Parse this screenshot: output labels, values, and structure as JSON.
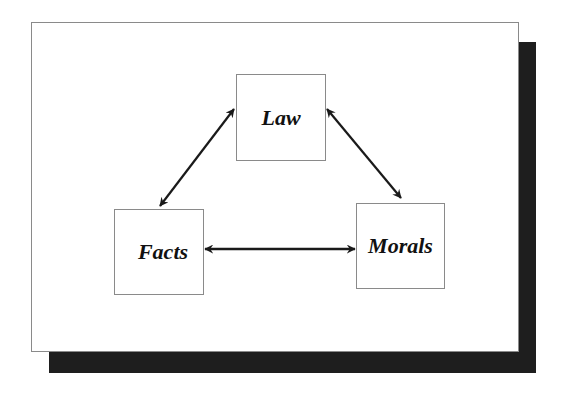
{
  "diagram": {
    "nodes": [
      {
        "id": "law",
        "label": "Law"
      },
      {
        "id": "facts",
        "label": "Facts"
      },
      {
        "id": "morals",
        "label": "Morals"
      }
    ],
    "edges": [
      {
        "from": "facts",
        "to": "law",
        "type": "bidirectional"
      },
      {
        "from": "law",
        "to": "morals",
        "type": "bidirectional"
      },
      {
        "from": "facts",
        "to": "morals",
        "type": "bidirectional"
      }
    ],
    "colors": {
      "shadow": "#1e1e1e",
      "border": "#8a8a8a",
      "arrow": "#1a1a1a"
    }
  }
}
